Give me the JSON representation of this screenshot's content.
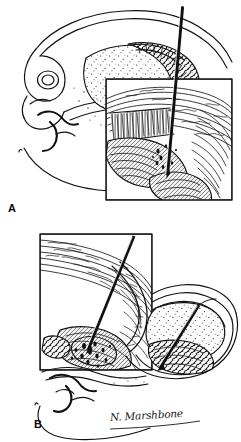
{
  "figure": {
    "background_color": "#ffffff",
    "ink_color": "#111111",
    "width": 241,
    "height": 442
  },
  "panels": [
    {
      "id": "A",
      "label": "A",
      "description": "Sagittal anatomical line drawing with stippled tissue mass, needle entering from upper right, and a rectangular magnification inset box over the lower right region showing fibrous lamellae and dense hatched tissue.",
      "inset_box": {
        "x": 106,
        "y": 79,
        "width": 126,
        "height": 121,
        "border_color": "#111111"
      },
      "needle": {
        "entry_x": 182,
        "entry_y": 7,
        "tip_x": 167,
        "tip_y": 175,
        "color": "#1a1a1a"
      }
    },
    {
      "id": "B",
      "label": "B",
      "description": "Second sagittal anatomical line drawing with a magnification inset box on the left showing striated fibrous band and hatched tissue, a needle passing down through the inset, and a second needle at right entering a stippled mass.",
      "inset_box": {
        "x": 40,
        "y": 234,
        "width": 112,
        "height": 136,
        "border_color": "#111111"
      },
      "needle_left": {
        "entry_x": 134,
        "entry_y": 236,
        "tip_x": 88,
        "tip_y": 350,
        "color": "#1a1a1a"
      },
      "needle_right": {
        "entry_x": 199,
        "entry_y": 305,
        "tip_x": 160,
        "tip_y": 368,
        "color": "#1a1a1a"
      }
    }
  ],
  "signature": {
    "text": "N. Marshbone",
    "color": "#161616"
  }
}
